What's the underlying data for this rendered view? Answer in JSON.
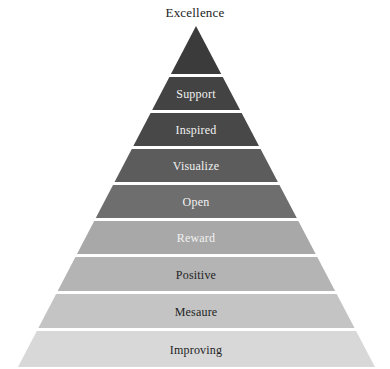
{
  "diagram": {
    "type": "pyramid",
    "title": "Excellence",
    "background_color": "#ffffff",
    "apex_label": "Excellence",
    "apex_label_color": "#1c1c1c",
    "divider_color": "#ffffff",
    "geometry": {
      "apex_x": 196,
      "apex_y": 26,
      "base_left_x": 18,
      "base_right_x": 375,
      "base_y": 367
    },
    "levels": [
      {
        "label": "Excellence",
        "label_position": "above-apex",
        "fill": "#3b3b3b",
        "text_color": "#1c1c1c",
        "top_y": 26,
        "bottom_y": 74
      },
      {
        "label": "Support",
        "label_position": "inside",
        "fill": "#434343",
        "text_color": "#f2f2f2",
        "top_y": 77,
        "bottom_y": 110
      },
      {
        "label": "Inspired",
        "label_position": "inside",
        "fill": "#484848",
        "text_color": "#f2f2f2",
        "top_y": 113,
        "bottom_y": 146
      },
      {
        "label": "Visualize",
        "label_position": "inside",
        "fill": "#5c5c5c",
        "text_color": "#f2f2f2",
        "top_y": 149,
        "bottom_y": 182
      },
      {
        "label": "Open",
        "label_position": "inside",
        "fill": "#6e6e6e",
        "text_color": "#f2f2f2",
        "top_y": 185,
        "bottom_y": 218
      },
      {
        "label": "Reward",
        "label_position": "inside",
        "fill": "#a8a8a8",
        "text_color": "#f2f2f2",
        "top_y": 221,
        "bottom_y": 254
      },
      {
        "label": "Positive",
        "label_position": "inside",
        "fill": "#b4b4b4",
        "text_color": "#232323",
        "top_y": 257,
        "bottom_y": 291
      },
      {
        "label": "Mesaure",
        "label_position": "inside",
        "fill": "#c4c4c4",
        "text_color": "#232323",
        "top_y": 294,
        "bottom_y": 328
      },
      {
        "label": "Improving",
        "label_position": "inside",
        "fill": "#d8d8d8",
        "text_color": "#232323",
        "top_y": 331,
        "bottom_y": 367
      }
    ]
  }
}
